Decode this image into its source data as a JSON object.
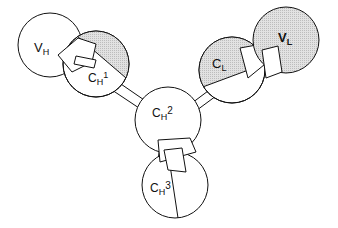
{
  "diagram": {
    "type": "antibody-domain-structure",
    "colors": {
      "stroke": "#111111",
      "fill": "#ffffff",
      "shade": "#d8d8d8"
    },
    "domains": [
      {
        "id": "VH",
        "main": "V",
        "sub": "H",
        "sup": "",
        "shaded": false
      },
      {
        "id": "CH1",
        "main": "C",
        "sub": "H",
        "sup": "1",
        "shaded": false
      },
      {
        "id": "CH2",
        "main": "C",
        "sub": "H",
        "sup": "2",
        "shaded": false
      },
      {
        "id": "CH3",
        "main": "C",
        "sub": "H",
        "sup": "3",
        "shaded": false
      },
      {
        "id": "CL",
        "main": "C",
        "sub": "L",
        "sup": "",
        "shaded": true
      },
      {
        "id": "VL",
        "main": "V",
        "sub": "L",
        "sup": "",
        "shaded": true
      }
    ]
  }
}
